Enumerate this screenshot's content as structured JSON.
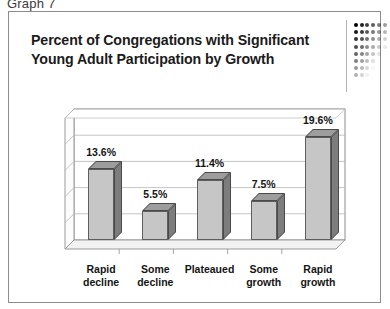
{
  "caption": "Graph 7",
  "slide": {
    "title_line_1": "Percent of Congregations with Significant",
    "title_line_2": "Young Adult Participation by Growth",
    "accent_color": "#000000",
    "frame_color": "#8d8d8d"
  },
  "decoration": {
    "divider_name": "title-divider",
    "dot_grid_cols": 6,
    "dot_grid_rows": 8
  },
  "chart_data": {
    "type": "bar",
    "title": "Percent of Congregations with Significant Young Adult Participation by Growth",
    "xlabel": "",
    "ylabel": "",
    "categories": [
      "Rapid decline",
      "Some decline",
      "Plateaued",
      "Some growth",
      "Rapid growth"
    ],
    "category_lines": [
      [
        "Rapid",
        "decline"
      ],
      [
        "Some",
        "decline"
      ],
      [
        "Plateaued",
        ""
      ],
      [
        "Some",
        "growth"
      ],
      [
        "Rapid",
        "growth"
      ]
    ],
    "values": [
      13.6,
      5.5,
      11.4,
      7.5,
      19.6
    ],
    "data_labels": [
      "13.6%",
      "5.5%",
      "11.4%",
      "7.5%",
      "19.6%"
    ],
    "ylim": [
      0,
      25
    ],
    "gridlines": [
      5,
      10,
      15,
      20,
      25
    ],
    "grid": true,
    "legend": "none",
    "bar_face_color": "#c6c6c6",
    "bar_side_color": "#7d7d7d",
    "bar_top_color": "#9d9d9d"
  }
}
